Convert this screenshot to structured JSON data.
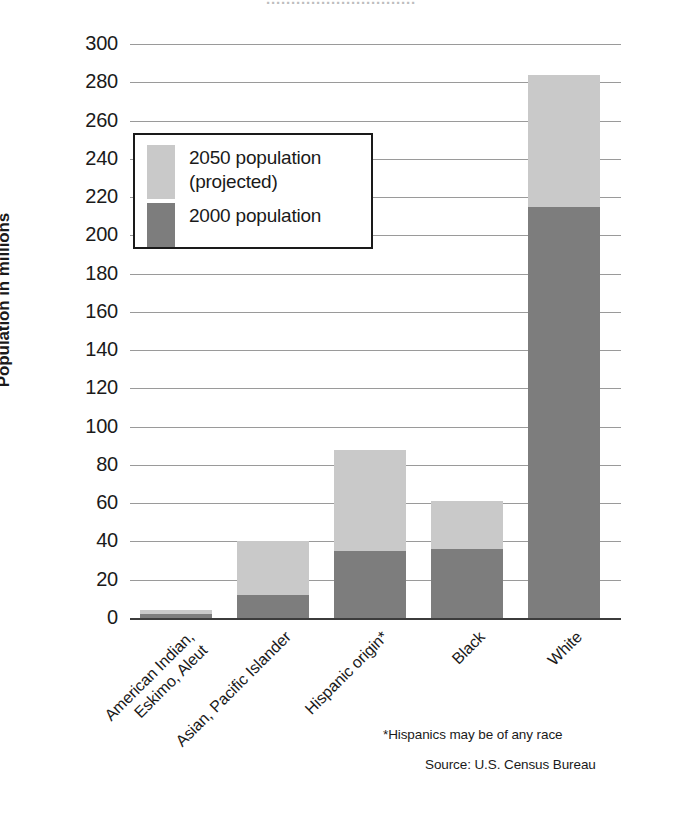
{
  "chart_data": {
    "type": "bar",
    "subtype": "stacked-bar",
    "title": "",
    "xlabel": "",
    "ylabel": "Population in millions",
    "ylim": [
      0,
      300
    ],
    "ytick_step": 20,
    "yticks": [
      300,
      280,
      260,
      240,
      220,
      200,
      180,
      160,
      140,
      120,
      100,
      80,
      60,
      40,
      20,
      0
    ],
    "grid": true,
    "legend_position": "upper-left-inside",
    "categories": [
      "American Indian,\nEskimo, Aleut",
      "Asian, Pacific Islander",
      "Hispanic origin*",
      "Black",
      "White"
    ],
    "category_labels": [
      {
        "line1": "American Indian,",
        "line2": "Eskimo, Aleut"
      },
      {
        "line1": "Asian, Pacific Islander",
        "line2": ""
      },
      {
        "line1": "Hispanic origin*",
        "line2": ""
      },
      {
        "line1": "Black",
        "line2": ""
      },
      {
        "line1": "White",
        "line2": ""
      }
    ],
    "series": [
      {
        "name": "2000 population",
        "color": "#7d7d7d",
        "values": [
          2,
          12,
          35,
          36,
          215
        ]
      },
      {
        "name": "2050 population (projected)",
        "color": "#c9c9c9",
        "values": [
          4,
          40,
          88,
          61,
          284
        ],
        "note": "values are cumulative bar tops"
      }
    ],
    "stack_tops": [
      4,
      40,
      88,
      61,
      284
    ],
    "annotations": [
      "*Hispanics may be of any race",
      "Source: U.S. Census Bureau"
    ]
  },
  "legend": {
    "items": [
      {
        "label_line1": "2050 population",
        "label_line2": "(projected)",
        "color": "#c9c9c9"
      },
      {
        "label_line1": "2000 population",
        "label_line2": "",
        "color": "#7d7d7d"
      }
    ]
  },
  "axis": {
    "y_title": "Population in millions"
  },
  "notes": {
    "hispanic": "*Hispanics may be of any race",
    "source": "Source: U.S. Census Bureau"
  },
  "cropped_header": {
    "text": "······························"
  },
  "colors": {
    "projected": "#c9c9c9",
    "base": "#7d7d7d",
    "grid": "#9a9a9a",
    "axis": "#3c3c3c",
    "text": "#1a1a1a",
    "background": "#ffffff"
  }
}
